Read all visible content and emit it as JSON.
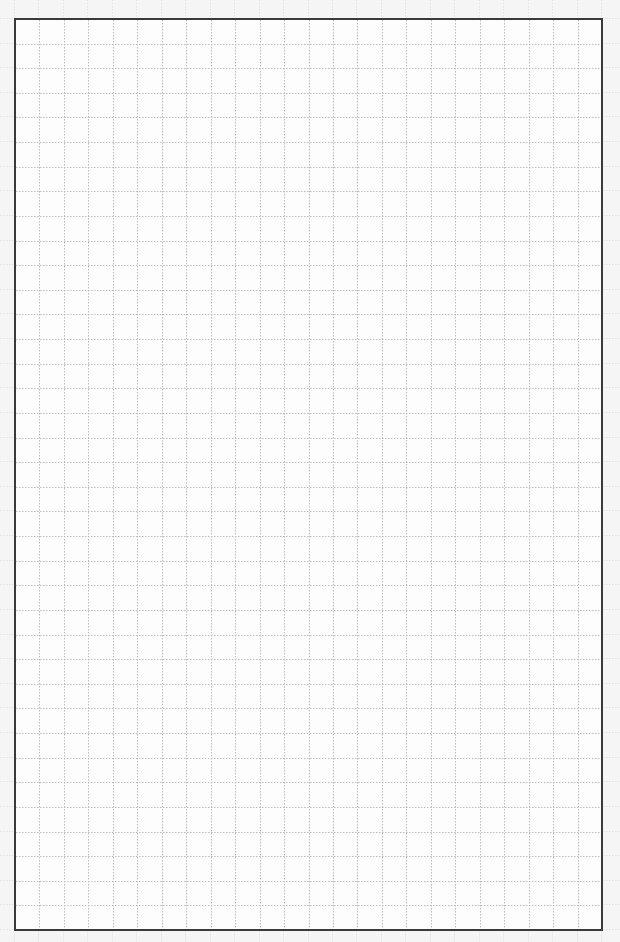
{
  "document": {
    "type": "grid-paper",
    "columns": 24,
    "rows": 37,
    "colors": {
      "page_background": "#f5f5f5",
      "sheet_background": "#fdfdfd",
      "border": "#3a3a3a",
      "grid_line": "#bdbdbd"
    },
    "grid_line_style": "dotted"
  }
}
